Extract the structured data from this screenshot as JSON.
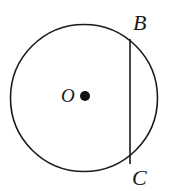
{
  "figure": {
    "type": "geometry-diagram",
    "background_color": "#ffffff",
    "stroke_color": "#1a1a1a",
    "labels": {
      "center": "O",
      "chord_top": "B",
      "chord_bottom": "C"
    },
    "shapes": {
      "circle": {
        "name": "circle",
        "cx": 84,
        "cy": 98,
        "r": 73.5,
        "stroke_width": 1.6
      },
      "center_dot": {
        "name": "center-point",
        "cx": 85,
        "cy": 96,
        "r": 5
      },
      "chord": {
        "name": "chord-BC",
        "x1": 130,
        "y1": 39,
        "x2": 130,
        "y2": 164,
        "stroke_width": 1.6
      }
    }
  }
}
